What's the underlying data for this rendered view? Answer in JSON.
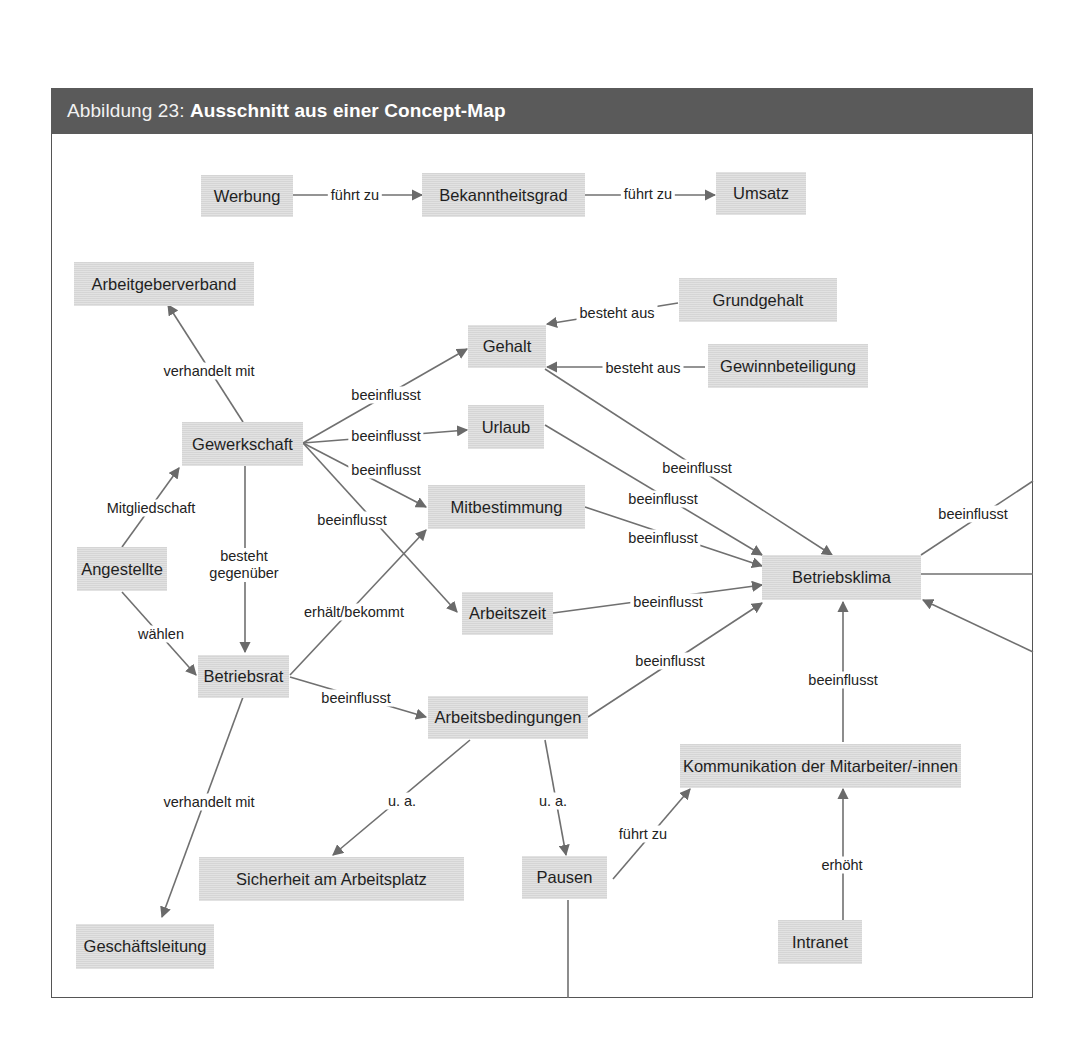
{
  "figure": {
    "label": "Abbildung 23:",
    "title": "Ausschnitt aus einer Concept-Map"
  },
  "nodes": {
    "werbung": "Werbung",
    "bekanntheitsgrad": "Bekanntheitsgrad",
    "umsatz": "Umsatz",
    "arbeitgeberverband": "Arbeitgeberverband",
    "grundgehalt": "Grundgehalt",
    "gehalt": "Gehalt",
    "gewinnbeteiligung": "Gewinnbeteiligung",
    "gewerkschaft": "Gewerkschaft",
    "urlaub": "Urlaub",
    "mitbestimmung": "Mitbestimmung",
    "angestellte": "Angestellte",
    "betriebsklima": "Betriebsklima",
    "arbeitszeit": "Arbeitszeit",
    "betriebsrat": "Betriebsrat",
    "arbeitsbedingungen": "Arbeitsbedingungen",
    "kommunikation": "Kommunikation der Mitarbeiter/-innen",
    "sicherheit": "Sicherheit am Arbeitsplatz",
    "pausen": "Pausen",
    "geschaeftsleitung": "Geschäftsleitung",
    "intranet": "Intranet"
  },
  "edges": [
    {
      "from": "Werbung",
      "to": "Bekanntheitsgrad",
      "label": "führt zu"
    },
    {
      "from": "Bekanntheitsgrad",
      "to": "Umsatz",
      "label": "führt zu"
    },
    {
      "from": "Gewerkschaft",
      "to": "Arbeitgeberverband",
      "label": "verhandelt mit"
    },
    {
      "from": "Grundgehalt",
      "to": "Gehalt",
      "label": "besteht aus"
    },
    {
      "from": "Gewinnbeteiligung",
      "to": "Gehalt",
      "label": "besteht aus"
    },
    {
      "from": "Gewerkschaft",
      "to": "Gehalt",
      "label": "beeinflusst"
    },
    {
      "from": "Gewerkschaft",
      "to": "Urlaub",
      "label": "beeinflusst"
    },
    {
      "from": "Gewerkschaft",
      "to": "Mitbestimmung",
      "label": "beeinflusst"
    },
    {
      "from": "Gewerkschaft",
      "to": "Arbeitszeit",
      "label": "beeinflusst"
    },
    {
      "from": "Angestellte",
      "to": "Gewerkschaft",
      "label": "Mitgliedschaft"
    },
    {
      "from": "Gewerkschaft",
      "to": "Betriebsrat",
      "label": "besteht gegenüber"
    },
    {
      "from": "Angestellte",
      "to": "Betriebsrat",
      "label": "wählen"
    },
    {
      "from": "Betriebsrat",
      "to": "Mitbestimmung",
      "label": "erhält/bekommt"
    },
    {
      "from": "Betriebsrat",
      "to": "Arbeitsbedingungen",
      "label": "beeinflusst"
    },
    {
      "from": "Betriebsrat",
      "to": "Geschäftsleitung",
      "label": "verhandelt mit"
    },
    {
      "from": "Gehalt",
      "to": "Betriebsklima",
      "label": "beeinflusst"
    },
    {
      "from": "Urlaub",
      "to": "Betriebsklima",
      "label": "beeinflusst"
    },
    {
      "from": "Mitbestimmung",
      "to": "Betriebsklima",
      "label": "beeinflusst"
    },
    {
      "from": "Arbeitszeit",
      "to": "Betriebsklima",
      "label": "beeinflusst"
    },
    {
      "from": "Arbeitsbedingungen",
      "to": "Betriebsklima",
      "label": "beeinflusst"
    },
    {
      "from": "Kommunikation der Mitarbeiter/-innen",
      "to": "Betriebsklima",
      "label": "beeinflusst"
    },
    {
      "from": "Betriebsklima",
      "to": "(off-frame right)",
      "label": "beeinflusst"
    },
    {
      "from": "Arbeitsbedingungen",
      "to": "Sicherheit am Arbeitsplatz",
      "label": "u. a."
    },
    {
      "from": "Arbeitsbedingungen",
      "to": "Pausen",
      "label": "u. a."
    },
    {
      "from": "Pausen",
      "to": "Kommunikation der Mitarbeiter/-innen",
      "label": "führt zu"
    },
    {
      "from": "Intranet",
      "to": "Kommunikation der Mitarbeiter/-innen",
      "label": "erhöht"
    }
  ],
  "labels": {
    "fuehrt_zu_1": "führt zu",
    "fuehrt_zu_2": "führt zu",
    "verhandelt_mit_1": "verhandelt mit",
    "besteht_aus_1": "besteht aus",
    "besteht_aus_2": "besteht aus",
    "beeinflusst_gew_gehalt": "beeinflusst",
    "beeinflusst_gew_urlaub": "beeinflusst",
    "beeinflusst_gew_mitb": "beeinflusst",
    "beeinflusst_gew_az": "beeinflusst",
    "mitgliedschaft": "Mitgliedschaft",
    "besteht_gegenueber_1": "besteht",
    "besteht_gegenueber_2": "gegenüber",
    "waehlen": "wählen",
    "erhaelt_bekommt": "erhält/bekommt",
    "beeinflusst_br_ab": "beeinflusst",
    "verhandelt_mit_2": "verhandelt mit",
    "beeinflusst_gehalt_bk": "beeinflusst",
    "beeinflusst_urlaub_bk": "beeinflusst",
    "beeinflusst_mitb_bk": "beeinflusst",
    "beeinflusst_az_bk": "beeinflusst",
    "beeinflusst_ab_bk": "beeinflusst",
    "beeinflusst_kom_bk": "beeinflusst",
    "beeinflusst_bk_right": "beeinflusst",
    "ua_1": "u. a.",
    "ua_2": "u. a.",
    "fuehrt_zu_3": "führt zu",
    "erhoeht": "erhöht"
  },
  "colors": {
    "header_bg": "#5a5a5a",
    "node_bg": "#dcdcdc",
    "edge": "#6a6a6a",
    "frame": "#555555"
  }
}
